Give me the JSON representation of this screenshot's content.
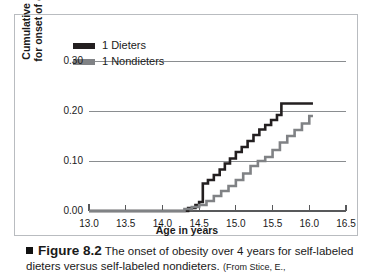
{
  "figure": {
    "caption_bullet": "square-bullet",
    "caption_label": "Figure 8.2",
    "caption_text": "The onset of obesity over 4 years for self-labeled dieters versus self-labeled nondieters.",
    "caption_source": "(From Stice, E.,"
  },
  "colors": {
    "dieters": "#231f20",
    "nondieters": "#808285",
    "grid": "#8a8d90",
    "axis": "#58595b",
    "frame": "#b9bcc0",
    "text": "#1a1a1a"
  },
  "chart_data": {
    "type": "line",
    "title": "",
    "subtitle": "",
    "xlabel": "Age in years",
    "ylabel": "Cumulative hazard for onset of obesity",
    "ylabel_lines": [
      "Cumulative hazard",
      "for onset of obesity"
    ],
    "xlim": [
      13.0,
      16.5
    ],
    "ylim": [
      0.0,
      0.3
    ],
    "xticks": [
      13.0,
      13.5,
      14.0,
      14.5,
      15.0,
      15.5,
      16.0,
      16.5
    ],
    "xticklabels": [
      "13.0",
      "13.5",
      "14.0",
      "14.5",
      "15.0",
      "15.5",
      "16.0",
      "16.5"
    ],
    "yticks": [
      0.0,
      0.1,
      0.2,
      0.3
    ],
    "yticklabels": [
      "0.00",
      "0.10",
      "0.20",
      "0.30"
    ],
    "grid": true,
    "grid_axis": "y",
    "step": "post",
    "legend_position": "top-left",
    "legend": [
      "1 Dieters",
      "1 Nondieters"
    ],
    "series": [
      {
        "name": "1 Dieters",
        "color": "#231f20",
        "x": [
          13.0,
          14.25,
          14.35,
          14.45,
          14.5,
          14.55,
          14.62,
          14.7,
          14.78,
          14.85,
          14.92,
          15.0,
          15.08,
          15.16,
          15.24,
          15.32,
          15.4,
          15.48,
          15.56,
          15.62,
          16.05
        ],
        "y": [
          0.0,
          0.0,
          0.006,
          0.012,
          0.018,
          0.055,
          0.062,
          0.072,
          0.083,
          0.095,
          0.105,
          0.118,
          0.128,
          0.14,
          0.152,
          0.163,
          0.172,
          0.182,
          0.192,
          0.215,
          0.215
        ]
      },
      {
        "name": "1 Nondieters",
        "color": "#808285",
        "x": [
          13.0,
          14.2,
          14.3,
          14.4,
          14.5,
          14.6,
          14.7,
          14.8,
          14.9,
          15.0,
          15.1,
          15.2,
          15.3,
          15.4,
          15.5,
          15.6,
          15.7,
          15.8,
          15.9,
          16.0,
          16.05
        ],
        "y": [
          0.0,
          0.0,
          0.004,
          0.008,
          0.012,
          0.02,
          0.03,
          0.04,
          0.05,
          0.062,
          0.075,
          0.09,
          0.1,
          0.108,
          0.122,
          0.137,
          0.15,
          0.162,
          0.175,
          0.19,
          0.19
        ]
      }
    ]
  }
}
